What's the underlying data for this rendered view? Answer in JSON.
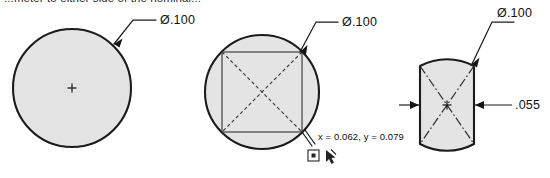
{
  "sheet": {
    "background": "#ffffff",
    "line_color": "#1b1b1b",
    "fill_color": "#e4e4e4",
    "width": 550,
    "height": 178
  },
  "caption": {
    "text": "...meter to either side of the nominal...",
    "note": "clipped at top edge of screenshot"
  },
  "figures": [
    {
      "id": "figure-left",
      "name": "nominal-circle",
      "shape": "circle",
      "dimension_label": "Ø.100",
      "has_center_mark": true,
      "annotations": []
    },
    {
      "id": "figure-middle",
      "name": "circle-with-inscribed-rectangle",
      "shape": "circle-with-rectangle",
      "dimension_label": "Ø.100",
      "coordinate_label": "x = 0.062, y = 0.079",
      "has_center_mark": false,
      "icons": [
        "sketch-point-icon",
        "pointer-cursor-icon"
      ]
    },
    {
      "id": "figure-right",
      "name": "circle-with-two-flats",
      "shape": "obround-flats",
      "dimension_label": "Ø.100",
      "width_label": ".055",
      "has_center_mark": true
    }
  ],
  "labels": {
    "diameter_left": "Ø.100",
    "diameter_middle": "Ø.100",
    "diameter_right": "Ø.100",
    "width_right": ".055",
    "coordinates_middle": "x = 0.062, y = 0.079"
  }
}
